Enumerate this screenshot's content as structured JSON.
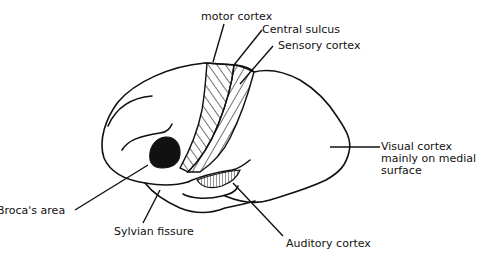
{
  "diagram": {
    "type": "labeled anatomical illustration",
    "labels": {
      "motor": "motor cortex",
      "central": "Central sulcus",
      "sensory": "Sensory cortex",
      "visual_1": "Visual cortex",
      "visual_2": "mainly on medial",
      "visual_3": "surface",
      "broca": "Broca's area",
      "sylvian": "Sylvian fissure",
      "auditory": "Auditory cortex"
    },
    "regions": [
      {
        "name": "motor cortex",
        "fill": "diagonal hatching"
      },
      {
        "name": "sensory cortex",
        "fill": "reverse diagonal hatching"
      },
      {
        "name": "Broca's area",
        "fill": "solid black"
      },
      {
        "name": "auditory cortex",
        "fill": "vertical hatching"
      }
    ],
    "colors": {
      "ink": "#111111",
      "background": "#ffffff"
    }
  }
}
